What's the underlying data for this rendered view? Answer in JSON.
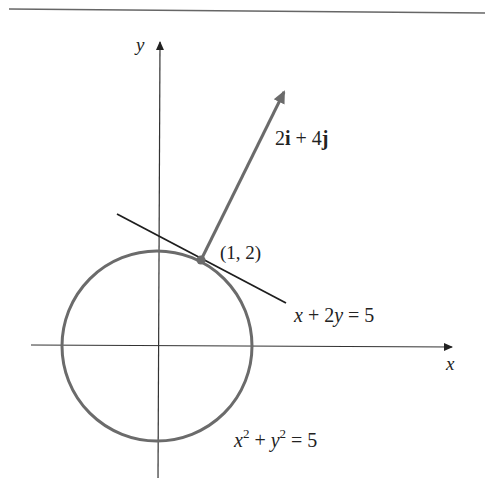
{
  "figure": {
    "type": "diagram",
    "colors": {
      "axes": "#333333",
      "circle": "#6b6b6b",
      "tangent_line": "#1e1e1e",
      "vector": "#6b6b6b",
      "point": "#6b6b6b",
      "top_rule": "#555555",
      "background": "#ffffff"
    },
    "axes": {
      "x_label": "x",
      "y_label": "y"
    },
    "point": {
      "label": "(1, 2)",
      "x": 1,
      "y": 2
    },
    "vector": {
      "label_parts": [
        "2",
        "i",
        " + 4",
        "j"
      ],
      "label": "2i + 4j",
      "from": [
        1,
        2
      ],
      "to": [
        3,
        6
      ]
    },
    "tangent": {
      "label_parts": [
        "x",
        " + 2",
        "y",
        " = 5"
      ],
      "label": "x + 2y = 5"
    },
    "circle": {
      "label_parts": [
        "x",
        "2",
        " + ",
        "y",
        "2",
        " = 5"
      ],
      "label": "x^2 + y^2 = 5",
      "center": [
        0,
        0
      ],
      "radius_squared": 5
    }
  }
}
